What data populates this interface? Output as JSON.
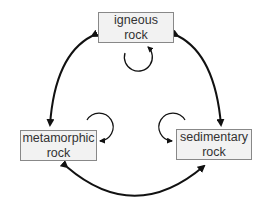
{
  "diagram": {
    "nodes": [
      {
        "id": "igneous",
        "line1": "igneous",
        "line2": "rock"
      },
      {
        "id": "metamorphic",
        "line1": "metamorphic",
        "line2": "rock"
      },
      {
        "id": "sedimentary",
        "line1": "sedimentary",
        "line2": "rock"
      }
    ],
    "edges": [
      {
        "from": "igneous",
        "to": "metamorphic",
        "bidirectional": true
      },
      {
        "from": "igneous",
        "to": "sedimentary",
        "bidirectional": true
      },
      {
        "from": "metamorphic",
        "to": "sedimentary",
        "bidirectional": true
      },
      {
        "from": "igneous",
        "to": "igneous",
        "self_loop": true
      },
      {
        "from": "metamorphic",
        "to": "metamorphic",
        "self_loop": true
      },
      {
        "from": "sedimentary",
        "to": "sedimentary",
        "self_loop": true
      }
    ],
    "colors": {
      "box_fill": "#f2f2f2",
      "box_border": "#888888",
      "arrow": "#111111"
    }
  }
}
